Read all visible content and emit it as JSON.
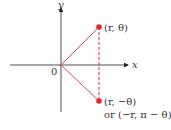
{
  "diagram": {
    "axes": {
      "x_label": "x",
      "y_label": "y",
      "origin_label": "0"
    },
    "points": [
      {
        "label": "(r, θ)"
      },
      {
        "label": "(r, −θ)",
        "alt_label": "or (−r, π − θ)"
      }
    ],
    "colors": {
      "point": "#e8242c",
      "line": "#d9534f",
      "axis": "#222222"
    }
  }
}
